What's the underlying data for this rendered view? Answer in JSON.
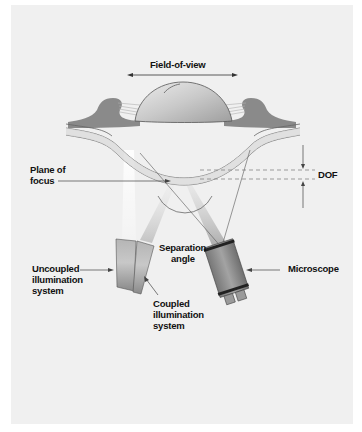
{
  "figure": {
    "type": "optical setup schematic",
    "background_color": "#f0f0f0",
    "labels": {
      "field_of_view": "Field-of-view",
      "plane_of_focus_line1": "Plane of",
      "plane_of_focus_line2": "focus",
      "dof": "DOF",
      "separation_angle_line1": "Separation",
      "separation_angle_line2": "angle",
      "uncoupled_line1": "Uncoupled",
      "uncoupled_line2": "illumination",
      "uncoupled_line3": "system",
      "coupled_line1": "Coupled",
      "coupled_line2": "illumination",
      "coupled_line3": "system",
      "microscope": "Microscope"
    },
    "components": [
      {
        "name": "lens",
        "color": "#c8c8c8"
      },
      {
        "name": "tissue",
        "color": "#8a8a8a"
      },
      {
        "name": "cornea",
        "color": "#d9d9d9"
      },
      {
        "name": "uncoupled-illumination-system",
        "color": "#9a9a9a"
      },
      {
        "name": "coupled-illumination-system",
        "color": "#a8a8a8"
      },
      {
        "name": "microscope",
        "color": "#8c8c8c"
      }
    ]
  }
}
